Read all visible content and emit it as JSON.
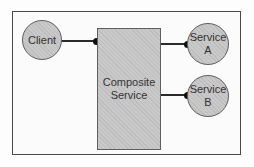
{
  "diagram": {
    "type": "architecture-diagram",
    "background": "#fdfdfd",
    "colors": {
      "shape_fill": "#c7c7c7",
      "shape_border": "#5f5f5f",
      "frame_border": "#4a4a4a",
      "connector": "#2b2b2b",
      "endpoint_dot": "#0f0f0f",
      "text": "#333333"
    },
    "nodes": {
      "client": {
        "shape": "circle",
        "lines": [
          "Client"
        ]
      },
      "composite_service": {
        "shape": "rectangle",
        "lines": [
          "Composite",
          "Service"
        ]
      },
      "service_a": {
        "shape": "circle",
        "lines": [
          "Service",
          "A"
        ]
      },
      "service_b": {
        "shape": "circle",
        "lines": [
          "Service",
          "B"
        ]
      }
    },
    "edges": [
      {
        "from": "client",
        "to": "composite_service",
        "endpoint": "filled-dot"
      },
      {
        "from": "composite_service",
        "to": "service_a",
        "endpoint": "filled-dot"
      },
      {
        "from": "composite_service",
        "to": "service_b",
        "endpoint": "filled-dot"
      }
    ]
  }
}
